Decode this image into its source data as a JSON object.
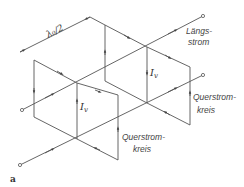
{
  "diagram": {
    "figure_label": "a",
    "dimension_label": "λ₀/2",
    "current_label_left": "I",
    "current_label_left_sub": "v",
    "current_label_right": "I",
    "current_label_right_sub": "v",
    "longitudinal_current": {
      "line1": "Längs-",
      "line2": "strom"
    },
    "transverse_loop_right": {
      "line1": "Querstrom-",
      "line2": "kreis"
    },
    "transverse_loop_lower": {
      "line1": "Querstrom-",
      "line2": "kreis"
    },
    "colors": {
      "line": "#555555",
      "background": "#ffffff"
    }
  }
}
